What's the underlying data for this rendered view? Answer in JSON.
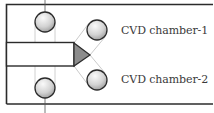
{
  "diagram": {
    "type": "cluster-tool-schematic",
    "chambers": [
      {
        "id": "chamber-1",
        "label": "CVD chamber-1"
      },
      {
        "id": "chamber-2",
        "label": "CVD chamber-2"
      }
    ],
    "colors": {
      "frame": "#2b2b2b",
      "guide_line": "#b8b8b8",
      "circle_fill_light": "#f4f4f4",
      "circle_fill_dark": "#9a9a9a",
      "triangle_fill": "#8c8c8c",
      "text": "#3a3a3a"
    }
  }
}
